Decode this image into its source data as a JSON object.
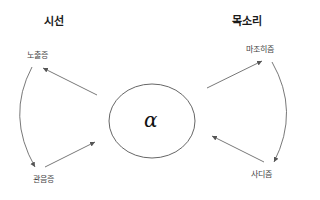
{
  "headings": {
    "left": "시선",
    "right": "목소리"
  },
  "center": {
    "symbol": "α"
  },
  "nodes": {
    "top_left": "노출증",
    "bottom_left": "관음증",
    "top_right": "마조히즘",
    "bottom_right": "사디즘"
  },
  "colors": {
    "line": "#555555",
    "text": "#444444",
    "heading": "#1a1a1a"
  }
}
